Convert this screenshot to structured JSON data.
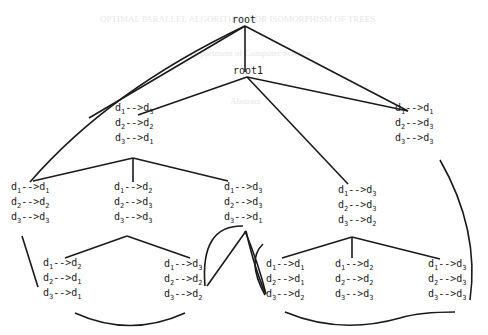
{
  "diagram": {
    "type": "tree",
    "root": {
      "label": "root"
    },
    "root1": {
      "label": "root1"
    },
    "edge_color": "#1a1a1a",
    "nodes": [
      {
        "id": "n_a",
        "rows": [
          [
            "1",
            "3"
          ],
          [
            "2",
            "2"
          ],
          [
            "3",
            "1"
          ]
        ]
      },
      {
        "id": "n_b",
        "rows": [
          [
            "1",
            "1"
          ],
          [
            "2",
            "3"
          ],
          [
            "3",
            "3"
          ]
        ]
      },
      {
        "id": "n_c",
        "rows": [
          [
            "1",
            "1"
          ],
          [
            "2",
            "2"
          ],
          [
            "3",
            "3"
          ]
        ]
      },
      {
        "id": "n_d",
        "rows": [
          [
            "1",
            "2"
          ],
          [
            "2",
            "3"
          ],
          [
            "3",
            "3"
          ]
        ]
      },
      {
        "id": "n_e",
        "rows": [
          [
            "1",
            "3"
          ],
          [
            "2",
            "3"
          ],
          [
            "3",
            "1"
          ]
        ]
      },
      {
        "id": "n_f",
        "rows": [
          [
            "1",
            "3"
          ],
          [
            "2",
            "3"
          ],
          [
            "3",
            "2"
          ]
        ]
      },
      {
        "id": "n_g",
        "rows": [
          [
            "1",
            "2"
          ],
          [
            "2",
            "1"
          ],
          [
            "3",
            "1"
          ]
        ]
      },
      {
        "id": "n_h",
        "rows": [
          [
            "1",
            "3"
          ],
          [
            "2",
            "2"
          ],
          [
            "3",
            "2"
          ]
        ]
      },
      {
        "id": "n_i",
        "rows": [
          [
            "1",
            "1"
          ],
          [
            "2",
            "1"
          ],
          [
            "3",
            "2"
          ]
        ]
      },
      {
        "id": "n_j",
        "rows": [
          [
            "1",
            "2"
          ],
          [
            "2",
            "2"
          ],
          [
            "3",
            "3"
          ]
        ]
      },
      {
        "id": "n_k",
        "rows": [
          [
            "1",
            "3"
          ],
          [
            "2",
            "3"
          ],
          [
            "3",
            "3"
          ]
        ]
      }
    ]
  },
  "background_text": {
    "line1": "OPTIMAL PARALLEL ALGORITHMS FOR ISOMORPHISM OF TREES",
    "line2": "Department of Computer Science",
    "line3": "Abstract"
  }
}
